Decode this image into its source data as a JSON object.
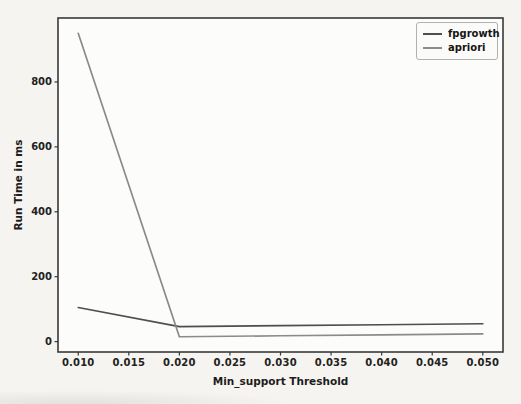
{
  "chart_data": {
    "type": "line",
    "title": "",
    "xlabel": "Min_support Threshold",
    "ylabel": "Run Time in ms",
    "x": [
      0.01,
      0.02,
      0.03,
      0.04,
      0.05
    ],
    "series": [
      {
        "name": "fpgrowth",
        "color": "#4f4e4c",
        "values": [
          105,
          46,
          49,
          52,
          55
        ]
      },
      {
        "name": "apriori",
        "color": "#8c8b89",
        "values": [
          950,
          15,
          18,
          21,
          24
        ]
      }
    ],
    "xlim": [
      0.008,
      0.052
    ],
    "ylim": [
      -32,
      997
    ],
    "x_ticks": {
      "values": [
        0.01,
        0.015,
        0.02,
        0.025,
        0.03,
        0.035,
        0.04,
        0.045,
        0.05
      ],
      "labels": [
        "0.010",
        "0.015",
        "0.020",
        "0.025",
        "0.030",
        "0.035",
        "0.040",
        "0.045",
        "0.050"
      ]
    },
    "y_ticks": {
      "values": [
        0,
        200,
        400,
        600,
        800
      ],
      "labels": [
        "0",
        "200",
        "400",
        "600",
        "800"
      ]
    },
    "grid": false,
    "legend": {
      "position": "upper right",
      "entries": [
        "fpgrowth",
        "apriori"
      ]
    }
  },
  "colors": {
    "spine": "#3a3938",
    "tick_mark": "#3a3938"
  }
}
